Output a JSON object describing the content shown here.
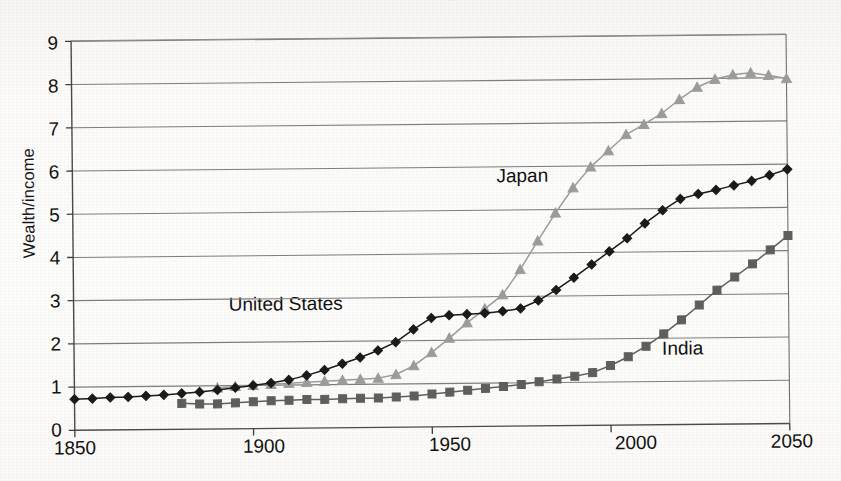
{
  "figure": {
    "title_partial": "and the United States, 1870–2100",
    "title_note": "top line of caption is cropped at image edge"
  },
  "chart_data": {
    "type": "line",
    "title": "and the United States, 1870–2100",
    "xlabel": "",
    "ylabel": "Wealth/income",
    "xlim": [
      1850,
      2050
    ],
    "ylim": [
      0,
      9
    ],
    "xticks": [
      1850,
      1900,
      1950,
      2000,
      2050
    ],
    "yticks": [
      0,
      1,
      2,
      3,
      4,
      5,
      6,
      7,
      8,
      9
    ],
    "grid": "horizontal",
    "legend": "inline-annotations",
    "annotations": [
      {
        "text": "Japan",
        "x": 1973,
        "y": 5.6
      },
      {
        "text": "United States",
        "x": 1912,
        "y": 2.95
      },
      {
        "text": "India",
        "x": 2018,
        "y": 1.55
      }
    ],
    "series": [
      {
        "name": "United States",
        "marker": "diamond",
        "color": "#1a1a1a",
        "x": [
          1850,
          1855,
          1860,
          1865,
          1870,
          1875,
          1880,
          1885,
          1890,
          1895,
          1900,
          1905,
          1910,
          1915,
          1920,
          1925,
          1930,
          1935,
          1940,
          1945,
          1950,
          1955,
          1960,
          1965,
          1970,
          1975,
          1980,
          1985,
          1990,
          1995,
          2000,
          2005,
          2010,
          2015,
          2020,
          2025,
          2030,
          2035,
          2040,
          2045,
          2050
        ],
        "y": [
          0.72,
          0.73,
          0.75,
          0.76,
          0.78,
          0.8,
          0.83,
          0.86,
          0.9,
          0.95,
          1.0,
          1.05,
          1.12,
          1.22,
          1.34,
          1.48,
          1.62,
          1.78,
          1.97,
          2.26,
          2.52,
          2.58,
          2.6,
          2.62,
          2.66,
          2.72,
          2.9,
          3.14,
          3.42,
          3.72,
          4.02,
          4.32,
          4.66,
          4.96,
          5.22,
          5.33,
          5.42,
          5.52,
          5.62,
          5.75,
          5.88
        ]
      },
      {
        "name": "Japan",
        "marker": "triangle",
        "color": "#9b9b9b",
        "x": [
          1890,
          1895,
          1900,
          1905,
          1910,
          1915,
          1920,
          1925,
          1930,
          1935,
          1940,
          1945,
          1950,
          1955,
          1960,
          1965,
          1970,
          1975,
          1980,
          1985,
          1990,
          1995,
          2000,
          2005,
          2010,
          2015,
          2020,
          2025,
          2030,
          2035,
          2040,
          2045,
          2050
        ],
        "y": [
          0.95,
          0.98,
          1.0,
          1.02,
          1.04,
          1.06,
          1.08,
          1.1,
          1.12,
          1.14,
          1.22,
          1.42,
          1.72,
          2.05,
          2.4,
          2.72,
          3.04,
          3.62,
          4.28,
          4.92,
          5.5,
          5.98,
          6.35,
          6.72,
          6.95,
          7.2,
          7.52,
          7.8,
          7.98,
          8.08,
          8.12,
          8.06,
          7.98
        ]
      },
      {
        "name": "India",
        "marker": "square",
        "color": "#5e5e5e",
        "x": [
          1880,
          1885,
          1890,
          1895,
          1900,
          1905,
          1910,
          1915,
          1920,
          1925,
          1930,
          1935,
          1940,
          1945,
          1950,
          1955,
          1960,
          1965,
          1970,
          1975,
          1980,
          1985,
          1990,
          1995,
          2000,
          2005,
          2010,
          2015,
          2020,
          2025,
          2030,
          2035,
          2040,
          2045,
          2050
        ],
        "y": [
          0.6,
          0.58,
          0.58,
          0.6,
          0.62,
          0.64,
          0.65,
          0.66,
          0.66,
          0.67,
          0.68,
          0.68,
          0.7,
          0.72,
          0.76,
          0.8,
          0.84,
          0.88,
          0.92,
          0.96,
          1.02,
          1.08,
          1.14,
          1.22,
          1.38,
          1.58,
          1.82,
          2.1,
          2.42,
          2.76,
          3.1,
          3.4,
          3.7,
          4.02,
          4.35
        ]
      }
    ]
  },
  "axis": {
    "y_label": "Wealth/income",
    "y_ticks": [
      "9",
      "8",
      "7",
      "6",
      "5",
      "4",
      "3",
      "2",
      "1",
      "0"
    ],
    "x_ticks": [
      "1850",
      "1900",
      "1950",
      "2000",
      "2050"
    ]
  },
  "labels": {
    "japan": "Japan",
    "united_states": "United States",
    "india": "India"
  }
}
